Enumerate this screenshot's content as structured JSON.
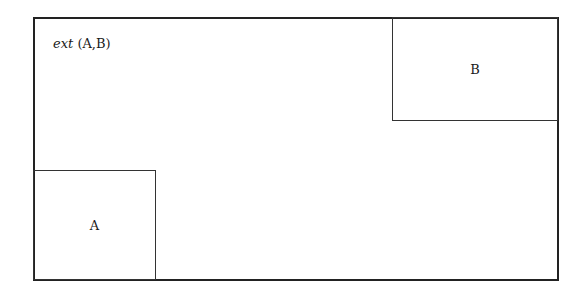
{
  "diagram": {
    "outer_region": {
      "label_prefix": "ext",
      "label_suffix": " (A,B)"
    },
    "boxes": [
      {
        "id": "A",
        "label": "A",
        "position": "bottom-left"
      },
      {
        "id": "B",
        "label": "B",
        "position": "top-right"
      }
    ],
    "colors": {
      "stroke": "#222222",
      "background": "#ffffff"
    }
  }
}
